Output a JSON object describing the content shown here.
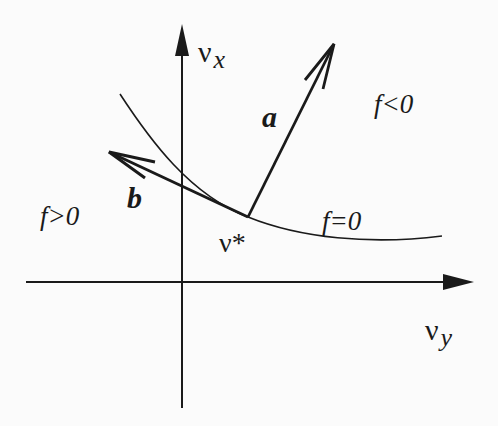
{
  "diagram": {
    "axes": {
      "vertical_label_main": "ν",
      "vertical_label_sub": "x",
      "horizontal_label_main": "ν",
      "horizontal_label_sub": "y"
    },
    "vectors": {
      "a_label": "a",
      "b_label": "b"
    },
    "point": {
      "label": "ν*"
    },
    "regions": {
      "negative": "f<0",
      "positive": "f>0",
      "boundary": "f=0"
    },
    "colors": {
      "ink": "#1a1a1a",
      "background": "#fbfbfb"
    }
  }
}
